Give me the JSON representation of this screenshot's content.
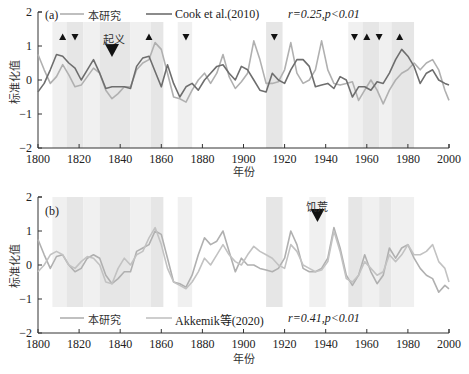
{
  "chart_data": [
    {
      "panel": "(a)",
      "type": "line",
      "xlabel": "年份",
      "ylabel": "标准化值",
      "xlim": [
        1800,
        2000
      ],
      "ylim": [
        -2,
        2
      ],
      "xticks": [
        1800,
        1820,
        1840,
        1860,
        1880,
        1900,
        1920,
        1940,
        1960,
        1980,
        2000
      ],
      "yticks": [
        -2,
        -1,
        0,
        1,
        2
      ],
      "legend": [
        "本研究",
        "Cook et al.(2010)"
      ],
      "annotation_stat": "r=0.25,p<0.01",
      "event_label": "起义",
      "event_year": 1836,
      "shaded_periods": [
        [
          1807,
          1814
        ],
        [
          1814,
          1822
        ],
        [
          1822,
          1830
        ],
        [
          1830,
          1845
        ],
        [
          1845,
          1855
        ],
        [
          1855,
          1861
        ],
        [
          1868,
          1875
        ],
        [
          1911,
          1919
        ],
        [
          1951,
          1958
        ],
        [
          1958,
          1966
        ],
        [
          1966,
          1972
        ],
        [
          1972,
          1983
        ]
      ],
      "markers": [
        {
          "year": 1812,
          "type": "up"
        },
        {
          "year": 1818,
          "type": "down"
        },
        {
          "year": 1854,
          "type": "up"
        },
        {
          "year": 1872,
          "type": "down"
        },
        {
          "year": 1915,
          "type": "down"
        },
        {
          "year": 1954,
          "type": "down"
        },
        {
          "year": 1960,
          "type": "up"
        },
        {
          "year": 1966,
          "type": "down"
        },
        {
          "year": 1976,
          "type": "up"
        }
      ],
      "series": [
        {
          "name": "本研究",
          "color": "#b0b0b0",
          "x": [
            1800,
            1803,
            1806,
            1809,
            1812,
            1815,
            1818,
            1821,
            1824,
            1827,
            1830,
            1833,
            1836,
            1839,
            1842,
            1845,
            1848,
            1851,
            1854,
            1857,
            1860,
            1863,
            1866,
            1869,
            1872,
            1875,
            1878,
            1881,
            1884,
            1887,
            1890,
            1893,
            1896,
            1899,
            1902,
            1905,
            1908,
            1911,
            1914,
            1917,
            1920,
            1923,
            1926,
            1929,
            1932,
            1935,
            1938,
            1941,
            1944,
            1947,
            1950,
            1953,
            1956,
            1959,
            1962,
            1965,
            1968,
            1971,
            1974,
            1977,
            1980,
            1983,
            1986,
            1989,
            1992,
            1995,
            1998,
            2000
          ],
          "values": [
            0.75,
            0.3,
            -0.1,
            0.1,
            0.45,
            0.15,
            -0.2,
            -0.15,
            0.1,
            0.35,
            0.2,
            -0.3,
            -0.55,
            -0.4,
            -0.2,
            -0.2,
            0.3,
            0.5,
            0.6,
            1.1,
            0.9,
            0.2,
            -0.5,
            -0.55,
            -0.65,
            -0.3,
            0.0,
            0.2,
            -0.1,
            0.2,
            0.75,
            0.1,
            -0.25,
            -0.05,
            0.2,
            1.15,
            0.6,
            -0.1,
            -0.1,
            -0.05,
            0.3,
            1.1,
            0.2,
            -0.1,
            0.0,
            0.3,
            1.15,
            0.3,
            -0.1,
            -0.15,
            -0.1,
            -0.05,
            -0.6,
            -0.3,
            0.0,
            -0.3,
            -0.7,
            -0.3,
            0.0,
            0.2,
            0.3,
            0.5,
            0.3,
            0.5,
            0.6,
            0.3,
            -0.3,
            -0.6
          ]
        },
        {
          "name": "Cook et al.(2010)",
          "color": "#707070",
          "x": [
            1800,
            1803,
            1806,
            1809,
            1812,
            1815,
            1818,
            1821,
            1824,
            1827,
            1830,
            1833,
            1836,
            1839,
            1842,
            1845,
            1848,
            1851,
            1854,
            1857,
            1860,
            1863,
            1866,
            1869,
            1872,
            1875,
            1878,
            1881,
            1884,
            1887,
            1890,
            1893,
            1896,
            1899,
            1902,
            1905,
            1908,
            1911,
            1914,
            1917,
            1920,
            1923,
            1926,
            1929,
            1932,
            1935,
            1938,
            1941,
            1944,
            1947,
            1950,
            1953,
            1956,
            1959,
            1962,
            1965,
            1968,
            1971,
            1974,
            1977,
            1980,
            1983,
            1986,
            1989,
            1992,
            1995,
            1998,
            2000
          ],
          "values": [
            -0.35,
            -0.1,
            0.3,
            0.75,
            0.7,
            0.5,
            0.35,
            0.0,
            0.3,
            0.6,
            0.2,
            -0.25,
            -0.2,
            -0.2,
            -0.2,
            -0.25,
            0.4,
            0.65,
            0.7,
            0.25,
            -0.2,
            0.45,
            -0.1,
            -0.5,
            -0.2,
            -0.1,
            -0.3,
            0.0,
            0.2,
            0.4,
            0.45,
            0.2,
            0.0,
            0.4,
            0.3,
            0.0,
            -0.3,
            -0.35,
            0.2,
            0.0,
            -0.1,
            0.3,
            0.6,
            0.6,
            0.4,
            -0.2,
            -0.15,
            -0.1,
            -0.25,
            0.1,
            0.0,
            -0.5,
            -0.2,
            -0.2,
            -0.3,
            -0.05,
            -0.1,
            0.2,
            0.6,
            0.9,
            0.7,
            0.4,
            -0.1,
            0.2,
            0.3,
            0.0,
            -0.1,
            -0.15
          ]
        }
      ]
    },
    {
      "panel": "(b)",
      "type": "line",
      "xlabel": "年份",
      "ylabel": "标准化值",
      "xlim": [
        1800,
        2000
      ],
      "ylim": [
        -2,
        2
      ],
      "xticks": [
        1800,
        1820,
        1840,
        1860,
        1880,
        1900,
        1920,
        1940,
        1960,
        1980,
        2000
      ],
      "yticks": [
        -2,
        -1,
        0,
        1,
        2
      ],
      "legend": [
        "本研究",
        "Akkemik等(2020)"
      ],
      "annotation_stat": "r=0.41,p<0.01",
      "event_label": "饥荒",
      "event_year": 1936,
      "shaded_periods": [
        [
          1807,
          1814
        ],
        [
          1814,
          1822
        ],
        [
          1822,
          1830
        ],
        [
          1830,
          1845
        ],
        [
          1845,
          1855
        ],
        [
          1855,
          1861
        ],
        [
          1868,
          1875
        ],
        [
          1911,
          1919
        ],
        [
          1932,
          1940
        ],
        [
          1951,
          1958
        ],
        [
          1958,
          1966
        ],
        [
          1966,
          1972
        ],
        [
          1972,
          1983
        ]
      ],
      "series": [
        {
          "name": "本研究",
          "color": "#a8a8a8",
          "x": [
            1800,
            1803,
            1806,
            1809,
            1812,
            1815,
            1818,
            1821,
            1824,
            1827,
            1830,
            1833,
            1836,
            1839,
            1842,
            1845,
            1848,
            1851,
            1854,
            1857,
            1860,
            1863,
            1866,
            1869,
            1872,
            1875,
            1878,
            1881,
            1884,
            1887,
            1890,
            1893,
            1896,
            1899,
            1902,
            1905,
            1908,
            1911,
            1914,
            1917,
            1920,
            1923,
            1926,
            1929,
            1932,
            1935,
            1938,
            1941,
            1944,
            1947,
            1950,
            1953,
            1956,
            1959,
            1962,
            1965,
            1968,
            1971,
            1974,
            1977,
            1980,
            1983,
            1986,
            1989,
            1992,
            1995,
            1998,
            2000
          ],
          "values": [
            0.75,
            0.3,
            -0.1,
            0.25,
            0.3,
            0.0,
            -0.2,
            -0.1,
            0.2,
            0.3,
            0.2,
            -0.3,
            -0.55,
            -0.4,
            -0.2,
            -0.2,
            0.4,
            0.5,
            0.6,
            1.0,
            0.9,
            0.2,
            -0.5,
            -0.55,
            -0.65,
            -0.3,
            0.3,
            0.8,
            0.6,
            0.7,
            1.0,
            0.4,
            -0.2,
            0.2,
            0.0,
            0.0,
            -0.1,
            -0.15,
            -0.2,
            -0.1,
            0.2,
            1.0,
            0.6,
            -0.1,
            -0.2,
            -0.2,
            -0.1,
            0.2,
            1.1,
            0.5,
            -0.3,
            -0.6,
            -0.3,
            0.3,
            -0.2,
            -0.55,
            -0.3,
            0.5,
            0.2,
            0.5,
            0.6,
            0.2,
            -0.1,
            -0.3,
            -0.4,
            -0.8,
            -0.6,
            -0.7
          ]
        },
        {
          "name": "Akkemik等(2020)",
          "color": "#c0c0c0",
          "x": [
            1800,
            1803,
            1806,
            1809,
            1812,
            1815,
            1818,
            1821,
            1824,
            1827,
            1830,
            1833,
            1836,
            1839,
            1842,
            1845,
            1848,
            1851,
            1854,
            1857,
            1860,
            1863,
            1866,
            1869,
            1872,
            1875,
            1878,
            1881,
            1884,
            1887,
            1890,
            1893,
            1896,
            1899,
            1902,
            1905,
            1908,
            1911,
            1914,
            1917,
            1920,
            1923,
            1926,
            1929,
            1932,
            1935,
            1938,
            1941,
            1944,
            1947,
            1950,
            1953,
            1956,
            1959,
            1962,
            1965,
            1968,
            1971,
            1974,
            1977,
            1980,
            1983,
            1986,
            1989,
            1992,
            1995,
            1998,
            2000
          ],
          "values": [
            -0.2,
            0.0,
            0.3,
            0.4,
            0.3,
            0.0,
            -0.1,
            0.1,
            0.25,
            0.2,
            0.0,
            -0.5,
            -0.55,
            -0.1,
            0.2,
            0.0,
            0.3,
            0.4,
            0.8,
            1.1,
            0.6,
            -0.1,
            -0.5,
            -0.6,
            -0.7,
            -0.5,
            -0.2,
            0.2,
            0.0,
            0.3,
            0.6,
            0.3,
            0.1,
            0.0,
            0.3,
            0.55,
            0.4,
            0.3,
            0.2,
            0.0,
            -0.1,
            0.6,
            0.4,
            0.0,
            -0.1,
            -0.2,
            -0.15,
            0.1,
            1.0,
            0.4,
            -0.4,
            -0.5,
            -0.3,
            0.1,
            -0.1,
            -0.3,
            -0.2,
            0.3,
            0.1,
            0.3,
            0.6,
            0.3,
            0.3,
            0.4,
            0.6,
            0.1,
            -0.1,
            -0.5
          ]
        }
      ]
    }
  ],
  "panel_a": {
    "label": "(a)",
    "legend_1": "本研究",
    "legend_2": "Cook et al.(2010)",
    "stat": "r=0.25,p<0.01",
    "event_label": "起义",
    "ylabel": "标准化值",
    "xlabel": "年份"
  },
  "panel_b": {
    "label": "(b)",
    "legend_1": "本研究",
    "legend_2": "Akkemik等(2020)",
    "stat": "r=0.41,p<0.01",
    "event_label": "饥荒",
    "ylabel": "标准化值",
    "xlabel": "年份"
  },
  "colors": {
    "line_study": "#b0b0b0",
    "line_ref_a": "#6e6e6e",
    "line_ref_b": "#c2c2c2",
    "shade_light": "#f0f0f0",
    "shade_dark": "#e6e6e6",
    "axis": "#333333",
    "marker": "#111111"
  }
}
